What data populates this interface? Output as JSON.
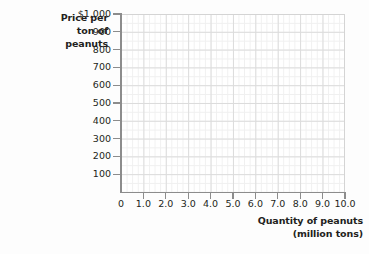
{
  "chart_data": {
    "type": "line",
    "title": "",
    "subtitle": "",
    "series": [],
    "annotations": [],
    "legend": null,
    "grid": true,
    "ylabel_lines": [
      "Price per",
      "ton of",
      "peanuts"
    ],
    "ylabel": "Price per ton of peanuts",
    "xlabel_lines": [
      "Quantity of peanuts",
      "(million tons)"
    ],
    "xlabel": "Quantity of peanuts (million tons)",
    "xlim": [
      0,
      10
    ],
    "ylim": [
      0,
      1000
    ],
    "x_ticks": [
      {
        "value": 0,
        "label": "0"
      },
      {
        "value": 1,
        "label": "1.0"
      },
      {
        "value": 2,
        "label": "2.0"
      },
      {
        "value": 3,
        "label": "3.0"
      },
      {
        "value": 4,
        "label": "4.0"
      },
      {
        "value": 5,
        "label": "5.0"
      },
      {
        "value": 6,
        "label": "6.0"
      },
      {
        "value": 7,
        "label": "7.0"
      },
      {
        "value": 8,
        "label": "8.0"
      },
      {
        "value": 9,
        "label": "9.0"
      },
      {
        "value": 10,
        "label": "10.0"
      }
    ],
    "y_ticks": [
      {
        "value": 1000,
        "label": "$1,000"
      },
      {
        "value": 900,
        "label": "900"
      },
      {
        "value": 800,
        "label": "800"
      },
      {
        "value": 700,
        "label": "700"
      },
      {
        "value": 600,
        "label": "600"
      },
      {
        "value": 500,
        "label": "500"
      },
      {
        "value": 400,
        "label": "400"
      },
      {
        "value": 300,
        "label": "300"
      },
      {
        "value": 200,
        "label": "200"
      },
      {
        "value": 100,
        "label": "100"
      }
    ],
    "colors": {
      "background": "#fdfdfd",
      "plot_background": "#ffffff",
      "grid_major": "#dcdcdc",
      "grid_minor": "#f0f0f0",
      "axis": "#8c8c8c",
      "text": "#231f20"
    }
  }
}
